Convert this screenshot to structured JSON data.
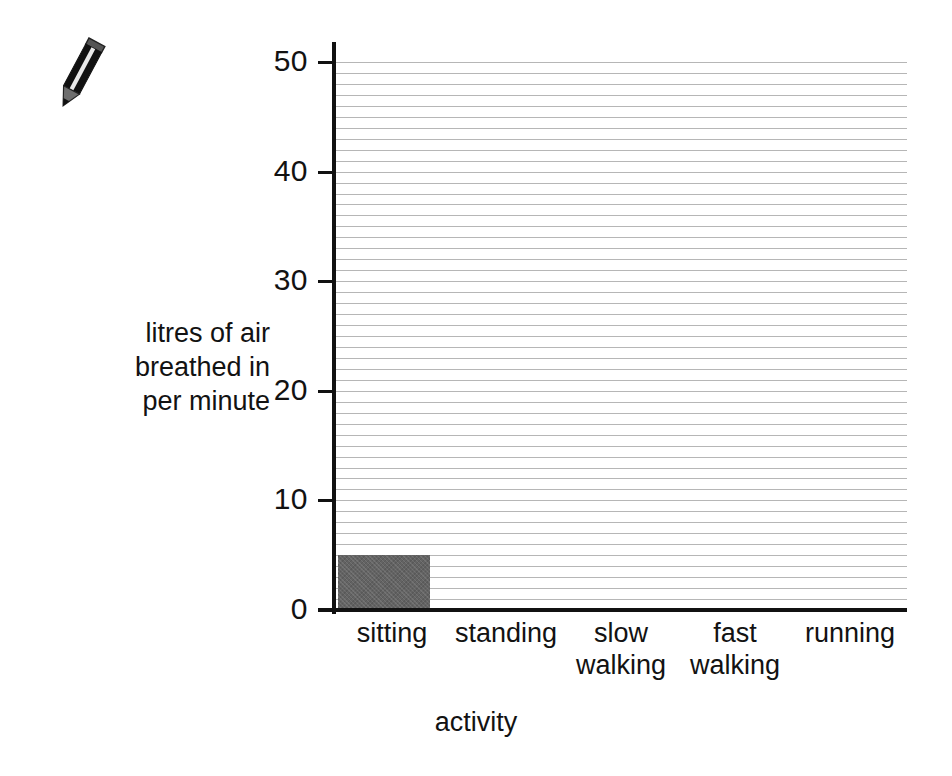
{
  "decoration": {
    "pencil_icon": "pencil-icon"
  },
  "chart_data": {
    "type": "bar",
    "title": "",
    "subtitle": "",
    "xlabel": "activity",
    "ylabel": "litres of air breathed in per minute",
    "ylabel_lines": [
      "litres of air",
      "breathed in",
      "per minute"
    ],
    "categories": [
      "sitting",
      "standing",
      "slow walking",
      "fast walking",
      "running"
    ],
    "category_label_lines": [
      [
        "sitting"
      ],
      [
        "standing"
      ],
      [
        "slow",
        "walking"
      ],
      [
        "fast",
        "walking"
      ],
      [
        "running"
      ]
    ],
    "values": [
      5,
      null,
      null,
      null,
      null
    ],
    "ylim": [
      0,
      50
    ],
    "y_major_ticks": [
      0,
      10,
      20,
      30,
      40,
      50
    ],
    "y_major_tick_labels": [
      "0",
      "10",
      "20",
      "30",
      "40",
      "50"
    ],
    "y_minor_tick_step": 1,
    "grid": true,
    "grid_orientation": "horizontal",
    "grid_step": 1,
    "legend": false,
    "legend_position": "none",
    "bar_color": "#636363",
    "axis_color": "#111111",
    "grid_color": "#a9a9a9",
    "note": "only the first category has a plotted bar; remaining bars are blank for the reader to complete"
  }
}
